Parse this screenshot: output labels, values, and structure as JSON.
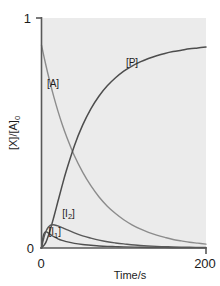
{
  "chart_data": {
    "type": "line",
    "title": "",
    "subtitle": "",
    "xlabel": "Time/s",
    "ylabel": "[X]/[A]0",
    "ylabel_base": "[X]/[A]",
    "ylabel_sub": "0",
    "xlim": [
      0,
      200
    ],
    "ylim": [
      0,
      1
    ],
    "xticks": [
      0,
      200
    ],
    "xticklabels": [
      "0",
      "200"
    ],
    "yticks": [
      0,
      1
    ],
    "yticklabels": [
      "0",
      "1"
    ],
    "grid": false,
    "legend_position": "inline-annotations",
    "plot_background": "#ebebeb",
    "axis_color": "#595959",
    "annotations": [
      {
        "text": "[A]",
        "x": 14,
        "y": 0.7
      },
      {
        "text": "[P]",
        "x": 110,
        "y": 0.79
      },
      {
        "text": "[I2]",
        "text_base": "[I",
        "text_sub": "2",
        "text_end": "]",
        "x": 33,
        "y": 0.135
      },
      {
        "text": "[I1]",
        "text_base": "[I",
        "text_sub": "1",
        "text_end": "]",
        "x": 16,
        "y": 0.055
      }
    ],
    "series": [
      {
        "name": "[A]",
        "color": "#8c8c8c",
        "width": 1.4,
        "x": [
          0,
          5,
          10,
          15,
          20,
          25,
          30,
          40,
          50,
          60,
          70,
          80,
          90,
          100,
          110,
          120,
          130,
          140,
          150,
          160,
          170,
          180,
          190,
          200
        ],
        "values": [
          0.882,
          0.8,
          0.725,
          0.657,
          0.595,
          0.539,
          0.489,
          0.401,
          0.33,
          0.271,
          0.222,
          0.182,
          0.15,
          0.123,
          0.101,
          0.083,
          0.068,
          0.056,
          0.046,
          0.037,
          0.031,
          0.025,
          0.021,
          0.017
        ]
      },
      {
        "name": "[P]",
        "color": "#4d4d4d",
        "width": 1.5,
        "x": [
          0,
          5,
          10,
          15,
          20,
          25,
          30,
          40,
          50,
          60,
          70,
          80,
          90,
          100,
          110,
          120,
          130,
          140,
          150,
          160,
          170,
          180,
          190,
          200
        ],
        "values": [
          0.0,
          0.022,
          0.072,
          0.135,
          0.203,
          0.27,
          0.334,
          0.445,
          0.534,
          0.605,
          0.661,
          0.705,
          0.74,
          0.769,
          0.791,
          0.809,
          0.824,
          0.836,
          0.846,
          0.854,
          0.86,
          0.866,
          0.87,
          0.874
        ]
      },
      {
        "name": "[I2]",
        "color": "#595959",
        "width": 1.4,
        "x": [
          0,
          2,
          4,
          6,
          8,
          10,
          12,
          14,
          16,
          20,
          25,
          30,
          40,
          50,
          60,
          70,
          80,
          90,
          100,
          120,
          140,
          160,
          180,
          200
        ],
        "values": [
          0.0,
          0.032,
          0.058,
          0.077,
          0.089,
          0.097,
          0.1,
          0.101,
          0.1,
          0.096,
          0.089,
          0.081,
          0.066,
          0.053,
          0.043,
          0.034,
          0.027,
          0.022,
          0.018,
          0.011,
          0.007,
          0.005,
          0.003,
          0.002
        ]
      },
      {
        "name": "[I1]",
        "color": "#4f4f4f",
        "width": 1.4,
        "x": [
          0,
          1,
          2,
          3,
          4,
          5,
          6,
          8,
          10,
          12,
          15,
          20,
          25,
          30,
          40,
          50,
          60,
          70,
          80,
          90,
          100,
          120,
          140,
          160,
          180,
          200
        ],
        "values": [
          0.0,
          0.03,
          0.05,
          0.062,
          0.068,
          0.07,
          0.07,
          0.066,
          0.061,
          0.056,
          0.049,
          0.04,
          0.033,
          0.028,
          0.02,
          0.015,
          0.012,
          0.009,
          0.007,
          0.006,
          0.005,
          0.003,
          0.002,
          0.001,
          0.001,
          0.001
        ]
      }
    ]
  }
}
